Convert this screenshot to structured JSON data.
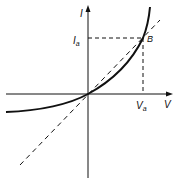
{
  "diagram": {
    "type": "iv-characteristic",
    "axes": {
      "x_label": "V",
      "y_label": "I"
    },
    "point": {
      "label": "B",
      "x_label": "V",
      "x_sub": "a",
      "y_label": "I",
      "y_sub": "a"
    },
    "colors": {
      "stroke": "#111111",
      "background": "#ffffff"
    }
  }
}
